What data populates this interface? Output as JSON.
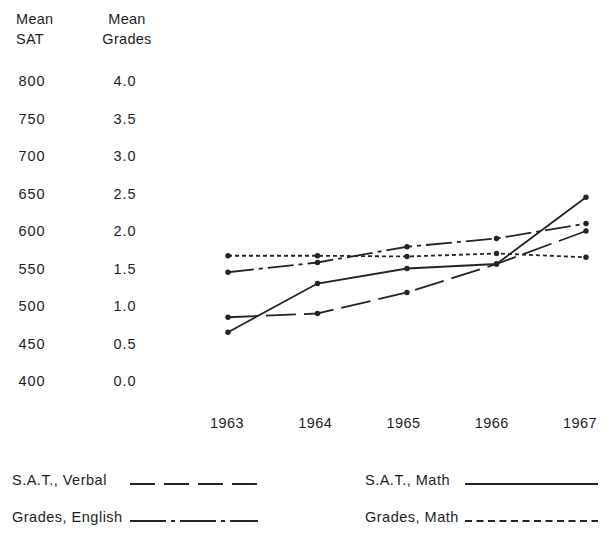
{
  "colors": {
    "background": "#ffffff",
    "line": "#242424",
    "text": "#1e1e1e"
  },
  "chart_data": {
    "type": "line",
    "title": "",
    "x_categories": [
      "1963",
      "1964",
      "1965",
      "1966",
      "1967"
    ],
    "sat_axis": {
      "title_lines": [
        "Mean",
        "SAT"
      ],
      "ticks": [
        "800",
        "750",
        "700",
        "650",
        "600",
        "550",
        "500",
        "450",
        "400"
      ],
      "range": [
        400,
        800
      ]
    },
    "grades_axis": {
      "title_lines": [
        "Mean",
        "Grades"
      ],
      "ticks": [
        "4.0",
        "3.5",
        "3.0",
        "2.5",
        "2.0",
        "1.5",
        "1.0",
        "0.5",
        "0.0"
      ],
      "range": [
        0.0,
        4.0
      ]
    },
    "series": [
      {
        "name": "S.A.T., Verbal",
        "axis": "sat",
        "line_style": "long-dash",
        "marker": "dot",
        "values": [
          485,
          490,
          518,
          556,
          600
        ]
      },
      {
        "name": "S.A.T., Math",
        "axis": "sat",
        "line_style": "solid",
        "marker": "dot",
        "values": [
          465,
          530,
          550,
          556,
          645
        ]
      },
      {
        "name": "Grades, English",
        "axis": "grades",
        "line_style": "dash-dot",
        "marker": "dot",
        "values": [
          1.45,
          1.58,
          1.79,
          1.9,
          2.1
        ]
      },
      {
        "name": "Grades, Math",
        "axis": "grades",
        "line_style": "short-dash",
        "marker": "dot",
        "values": [
          1.67,
          1.67,
          1.66,
          1.7,
          1.65
        ]
      }
    ],
    "grid": false,
    "legend_position": "bottom"
  },
  "legend": {
    "items": [
      {
        "label": "S.A.T., Verbal",
        "line_style": "long-dash"
      },
      {
        "label": "S.A.T., Math",
        "line_style": "solid"
      },
      {
        "label": "Grades, English",
        "line_style": "dash-dot"
      },
      {
        "label": "Grades, Math",
        "line_style": "short-dash"
      }
    ]
  }
}
